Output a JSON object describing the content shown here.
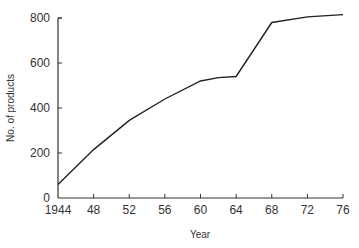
{
  "chart_data": {
    "type": "line",
    "title": "",
    "xlabel": "Year",
    "ylabel": "No. of products",
    "x_tick_labels": [
      "1944",
      "48",
      "52",
      "56",
      "60",
      "64",
      "68",
      "72",
      "76"
    ],
    "y_tick_labels": [
      "0",
      "200",
      "400",
      "600",
      "800"
    ],
    "xlim": [
      1944,
      1976
    ],
    "ylim": [
      0,
      800
    ],
    "grid": false,
    "legend": null,
    "series": [
      {
        "name": "No. of products",
        "x": [
          1944,
          1948,
          1952,
          1956,
          1960,
          1962,
          1964,
          1968,
          1972,
          1976
        ],
        "values": [
          60,
          215,
          345,
          440,
          520,
          535,
          540,
          780,
          805,
          815
        ]
      }
    ]
  }
}
